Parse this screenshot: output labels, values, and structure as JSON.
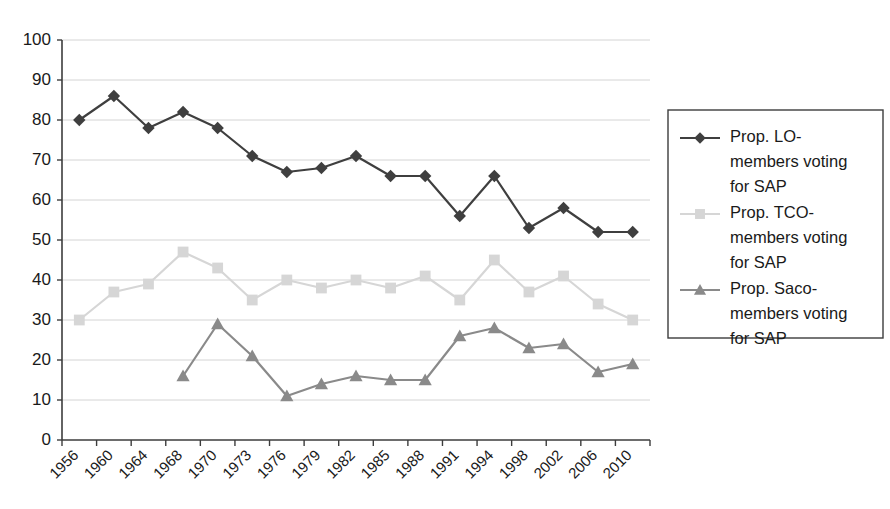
{
  "chart_data": {
    "type": "line",
    "title": "",
    "xlabel": "",
    "ylabel": "",
    "ylim": [
      0,
      100
    ],
    "ytick_step": 10,
    "grid": true,
    "legend_position": "right",
    "categories": [
      "1956",
      "1960",
      "1964",
      "1968",
      "1970",
      "1973",
      "1976",
      "1979",
      "1982",
      "1985",
      "1988",
      "1991",
      "1994",
      "1998",
      "2002",
      "2006",
      "2010"
    ],
    "ytick_labels": [
      "0",
      "10",
      "20",
      "30",
      "40",
      "50",
      "60",
      "70",
      "80",
      "90",
      "100"
    ],
    "series": [
      {
        "name": "Prop. LO-members voting for SAP",
        "legend_label_lines": [
          "Prop. LO-",
          "members voting",
          "for SAP"
        ],
        "color": "#3f3f3f",
        "marker": "diamond",
        "values": [
          80,
          86,
          78,
          82,
          78,
          71,
          67,
          68,
          71,
          66,
          66,
          56,
          66,
          53,
          58,
          52,
          52
        ]
      },
      {
        "name": "Prop. TCO-members voting for SAP",
        "legend_label_lines": [
          "Prop. TCO-",
          "members voting",
          "for SAP"
        ],
        "color": "#d6d6d6",
        "marker": "square",
        "values": [
          30,
          37,
          39,
          47,
          43,
          35,
          40,
          38,
          40,
          38,
          41,
          35,
          45,
          37,
          41,
          34,
          30
        ]
      },
      {
        "name": "Prop. Saco-members voting for SAP",
        "legend_label_lines": [
          "Prop. Saco-",
          "members voting",
          "for SAP"
        ],
        "color": "#8a8a8a",
        "marker": "triangle",
        "values": [
          null,
          null,
          null,
          16,
          29,
          21,
          11,
          14,
          16,
          15,
          15,
          26,
          28,
          23,
          24,
          17,
          19
        ]
      }
    ]
  }
}
